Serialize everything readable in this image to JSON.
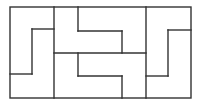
{
  "diagram": {
    "type": "rectangle-tiling-puzzle",
    "stroke_color": "#333333",
    "background": "#ffffff",
    "outer": {
      "x": 10,
      "y": 7,
      "w": 181,
      "h": 91
    },
    "segments": [
      {
        "x1": 54,
        "y1": 7,
        "x2": 54,
        "y2": 98
      },
      {
        "x1": 32,
        "y1": 29,
        "x2": 54,
        "y2": 29
      },
      {
        "x1": 32,
        "y1": 29,
        "x2": 32,
        "y2": 74
      },
      {
        "x1": 10,
        "y1": 74,
        "x2": 32,
        "y2": 74
      },
      {
        "x1": 54,
        "y1": 53,
        "x2": 146,
        "y2": 53
      },
      {
        "x1": 78,
        "y1": 7,
        "x2": 78,
        "y2": 31
      },
      {
        "x1": 78,
        "y1": 31,
        "x2": 122,
        "y2": 31
      },
      {
        "x1": 122,
        "y1": 31,
        "x2": 122,
        "y2": 53
      },
      {
        "x1": 78,
        "y1": 53,
        "x2": 78,
        "y2": 76
      },
      {
        "x1": 78,
        "y1": 76,
        "x2": 122,
        "y2": 76
      },
      {
        "x1": 122,
        "y1": 76,
        "x2": 122,
        "y2": 98
      },
      {
        "x1": 146,
        "y1": 7,
        "x2": 146,
        "y2": 98
      },
      {
        "x1": 168,
        "y1": 30,
        "x2": 191,
        "y2": 30
      },
      {
        "x1": 168,
        "y1": 30,
        "x2": 168,
        "y2": 76
      },
      {
        "x1": 146,
        "y1": 76,
        "x2": 168,
        "y2": 76
      }
    ]
  }
}
